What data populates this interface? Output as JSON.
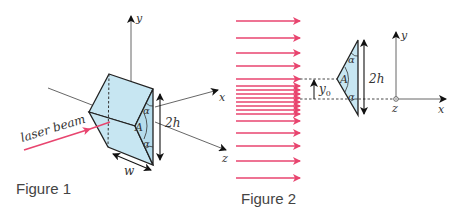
{
  "figure1": {
    "caption": "Figure 1",
    "beam_label": "laser beam",
    "axis_y": "y",
    "axis_x": "x",
    "axis_z": "z",
    "height_label": "2h",
    "width_label": "w",
    "apex_label": "A",
    "angle_top": "α",
    "angle_bottom": "α"
  },
  "figure2": {
    "caption": "Figure 2",
    "offset_label": "y",
    "offset_sub": "0",
    "height_label": "2h",
    "apex_label": "A",
    "angle_top": "α",
    "angle_bottom": "α",
    "axis_y": "y",
    "axis_x": "x",
    "axis_z": "z",
    "arrow_count": 19
  },
  "colors": {
    "prism_fill": "#c7e6f2",
    "beam": "#e8456f",
    "line": "#222222",
    "axis": "#555555"
  }
}
